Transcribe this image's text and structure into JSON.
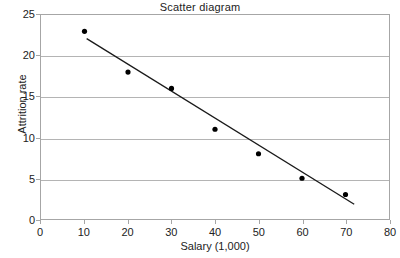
{
  "chart_data": {
    "type": "scatter",
    "title": "Scatter diagram",
    "xlabel": "Salary (1,000)",
    "ylabel": "Attrition rate",
    "xlim": [
      0,
      80
    ],
    "ylim": [
      0,
      25
    ],
    "xticks": [
      0,
      10,
      20,
      30,
      40,
      50,
      60,
      70,
      80
    ],
    "yticks": [
      0,
      5,
      10,
      15,
      20,
      25
    ],
    "grid": "horizontal",
    "legend": "none",
    "x": [
      10,
      20,
      30,
      40,
      50,
      60,
      70
    ],
    "y": [
      23,
      18,
      16,
      11,
      8,
      5,
      3
    ],
    "points": [
      {
        "x": 10,
        "y": 23
      },
      {
        "x": 20,
        "y": 18
      },
      {
        "x": 30,
        "y": 16
      },
      {
        "x": 40,
        "y": 11
      },
      {
        "x": 50,
        "y": 8
      },
      {
        "x": 60,
        "y": 5
      },
      {
        "x": 70,
        "y": 3
      }
    ],
    "trendline": {
      "x1": 10.5,
      "y1": 22.1,
      "x2": 72.0,
      "y2": 1.8
    },
    "colors": {
      "marker": "#000000",
      "trendline": "#1a1a1a",
      "gridline": "#b4b4b4",
      "border": "#a6a6a6",
      "background": "#ffffff",
      "text": "#222222"
    }
  }
}
